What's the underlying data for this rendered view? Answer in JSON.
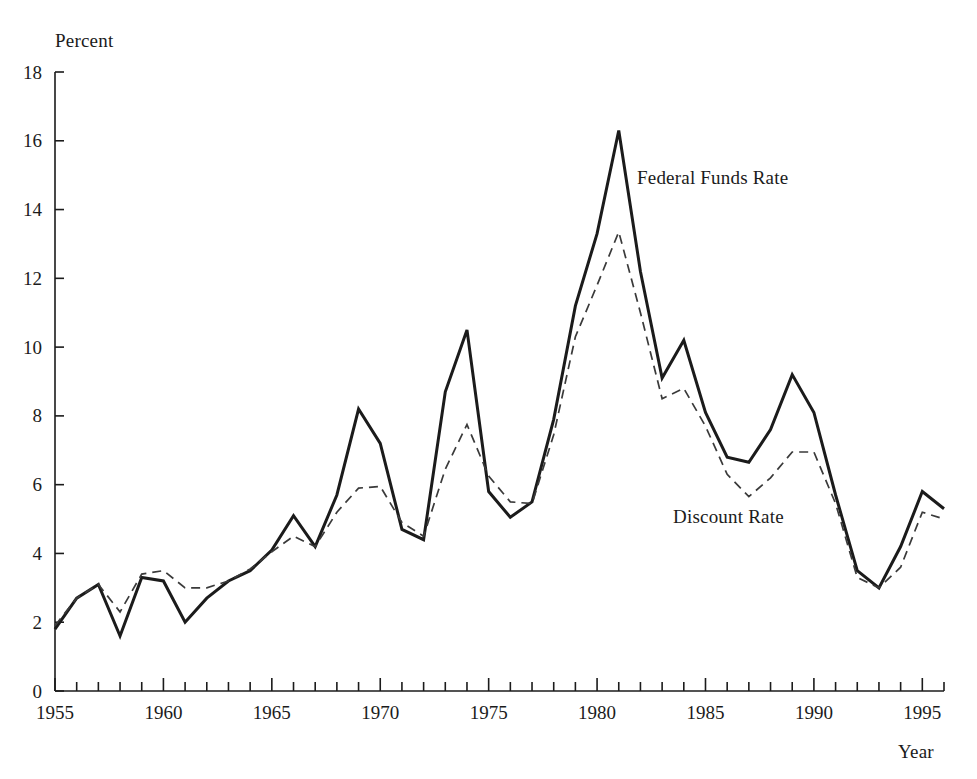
{
  "chart_data": {
    "type": "line",
    "title": "",
    "xlabel": "Year",
    "ylabel": "Percent",
    "xlim": [
      1955,
      1996
    ],
    "ylim": [
      0,
      18
    ],
    "grid": false,
    "legend_position": "inline-annotations",
    "x_ticks_major": [
      1955,
      1960,
      1965,
      1970,
      1975,
      1980,
      1985,
      1990,
      1995
    ],
    "x_tick_labels": [
      "1955",
      "1960",
      "1965",
      "1970",
      "1975",
      "1980",
      "1985",
      "1990",
      "1995"
    ],
    "x_ticks_minor_step": 1,
    "y_ticks": [
      0,
      2,
      4,
      6,
      8,
      10,
      12,
      14,
      16,
      18
    ],
    "y_tick_labels": [
      "0",
      "2",
      "4",
      "6",
      "8",
      "10",
      "12",
      "14",
      "16",
      "18"
    ],
    "x": [
      1955,
      1956,
      1957,
      1958,
      1959,
      1960,
      1961,
      1962,
      1963,
      1964,
      1965,
      1966,
      1967,
      1968,
      1969,
      1970,
      1971,
      1972,
      1973,
      1974,
      1975,
      1976,
      1977,
      1978,
      1979,
      1980,
      1981,
      1982,
      1983,
      1984,
      1985,
      1986,
      1987,
      1988,
      1989,
      1990,
      1991,
      1992,
      1993,
      1994,
      1995,
      1996
    ],
    "series": [
      {
        "name": "Federal Funds Rate",
        "style": "solid",
        "color": "#1b1b1b",
        "values": [
          1.8,
          2.7,
          3.1,
          1.6,
          3.3,
          3.2,
          2.0,
          2.7,
          3.2,
          3.5,
          4.1,
          5.1,
          4.2,
          5.7,
          8.2,
          7.2,
          4.7,
          4.4,
          8.7,
          10.5,
          5.8,
          5.05,
          5.5,
          7.9,
          11.2,
          13.3,
          16.3,
          12.2,
          9.1,
          10.2,
          8.1,
          6.8,
          6.65,
          7.6,
          9.2,
          8.1,
          5.7,
          3.5,
          3.0,
          4.2,
          5.8,
          5.3
        ]
      },
      {
        "name": "Discount Rate",
        "style": "dashed",
        "color": "#3a3a3a",
        "values": [
          1.9,
          2.7,
          3.1,
          2.3,
          3.4,
          3.5,
          3.0,
          3.0,
          3.2,
          3.55,
          4.05,
          4.5,
          4.2,
          5.2,
          5.9,
          5.95,
          4.9,
          4.5,
          6.45,
          7.75,
          6.25,
          5.5,
          5.45,
          7.45,
          10.3,
          11.8,
          13.35,
          11.0,
          8.5,
          8.8,
          7.7,
          6.3,
          5.65,
          6.2,
          6.95,
          6.95,
          5.45,
          3.3,
          3.0,
          3.6,
          5.2,
          5.0
        ]
      }
    ]
  },
  "axes": {
    "y_axis_title": "Percent",
    "x_axis_title": "Year"
  },
  "annotations": {
    "federal_funds_rate": "Federal Funds Rate",
    "discount_rate": "Discount Rate"
  },
  "colors": {
    "ink": "#1b1b1b",
    "dashed_ink": "#3a3a3a",
    "background": "#ffffff"
  }
}
